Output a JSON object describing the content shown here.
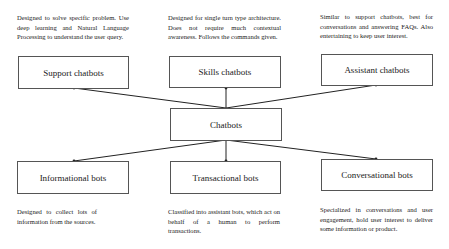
{
  "diagram": {
    "center": {
      "label": "Chatbots"
    },
    "top": [
      {
        "label": "Support chatbots",
        "description": "Designed to solve specific problem. Use deep learning and Natural Language Processing to understand the user query."
      },
      {
        "label": "Skills chatbots",
        "description": "Designed for single turn type architecture. Does not require much contextual awareness. Follows the commands given."
      },
      {
        "label": "Assistant chatbots",
        "description": "Similar to support chatbots, best for conversations and answering FAQs. Also entertaining to keep user interest."
      }
    ],
    "bottom": [
      {
        "label": "Informational bots",
        "description": "Designed to collect lots of information from the sources."
      },
      {
        "label": "Transactional bots",
        "description": "Classified into assistant bots, which act on behalf of a human to perform transactions."
      },
      {
        "label": "Conversational bots",
        "description": "Specialized in conversations and user engagement, hold user interest to deliver some information or product."
      }
    ],
    "colors": {
      "line": "#222222",
      "border": "#555555",
      "text": "#222222"
    }
  }
}
